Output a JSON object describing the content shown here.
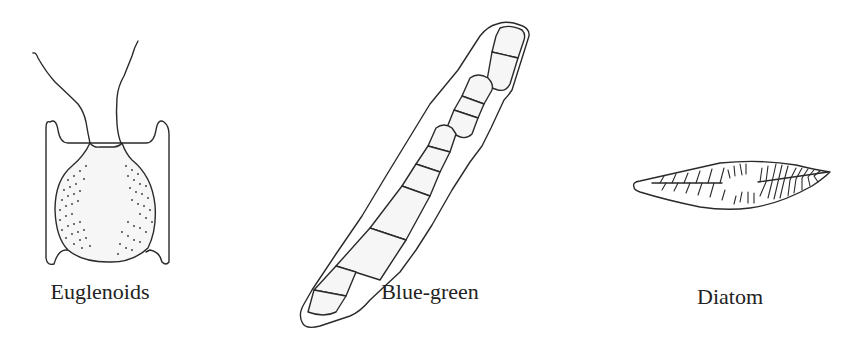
{
  "figure": {
    "organisms": [
      {
        "id": "euglenoids",
        "label": "Euglenoids",
        "label_x": 100,
        "label_y": 281
      },
      {
        "id": "blue-green",
        "label": "Blue-green",
        "label_x": 430,
        "label_y": 281
      },
      {
        "id": "diatom",
        "label": "Diatom",
        "label_x": 730,
        "label_y": 286
      }
    ],
    "colors": {
      "line": "#2a2a2a",
      "text": "#222222",
      "background": "#ffffff"
    }
  }
}
